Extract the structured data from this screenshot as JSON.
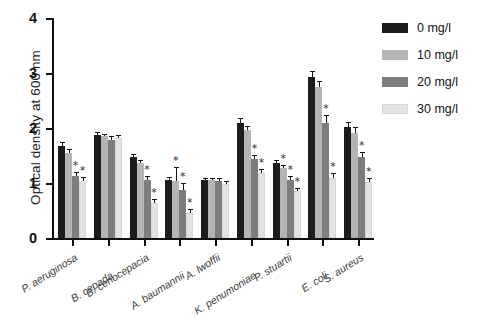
{
  "chart_data": {
    "type": "bar",
    "title": "",
    "xlabel": "",
    "ylabel": "Optical density at 600 nm",
    "ylim": [
      0,
      4
    ],
    "yticks": [
      0,
      1,
      2,
      3,
      4
    ],
    "ytick_labels": [
      "0",
      "1",
      "2",
      "3",
      "4"
    ],
    "grid": false,
    "legend_position": "right",
    "categories": [
      "P. aeruginosa",
      "B. cepada",
      "B. cenocepacia",
      "A. baumannii",
      "A. lwoffii",
      "K. penumoniae",
      "P. stuartii",
      "E. coli",
      "S. aureus"
    ],
    "series": [
      {
        "name": "0 mg/l",
        "color": "#1c1c1c",
        "values": [
          1.67,
          1.87,
          1.47,
          1.05,
          1.05,
          2.1,
          1.36,
          2.92,
          2.02
        ],
        "errors": [
          0.05,
          0.04,
          0.04,
          0.04,
          0.03,
          0.07,
          0.04,
          0.09,
          0.08
        ],
        "significant": [
          false,
          false,
          false,
          false,
          false,
          false,
          false,
          false,
          false
        ]
      },
      {
        "name": "10 mg/l",
        "color": "#b4b4b4",
        "values": [
          1.55,
          1.85,
          1.36,
          1.04,
          1.05,
          1.97,
          1.27,
          2.75,
          1.91
        ],
        "errors": [
          0.05,
          0.03,
          0.04,
          0.24,
          0.03,
          0.05,
          0.04,
          0.09,
          0.09
        ],
        "significant": [
          false,
          false,
          false,
          true,
          false,
          false,
          true,
          false,
          false
        ]
      },
      {
        "name": "20 mg/l",
        "color": "#7d7d7d",
        "values": [
          1.12,
          1.79,
          1.06,
          0.87,
          1.04,
          1.44,
          1.06,
          2.1,
          1.48
        ],
        "errors": [
          0.07,
          0.04,
          0.05,
          0.12,
          0.03,
          0.06,
          0.05,
          0.12,
          0.06
        ],
        "significant": [
          true,
          false,
          true,
          true,
          false,
          true,
          true,
          true,
          true
        ]
      },
      {
        "name": "30 mg/l",
        "color": "#e3e3e3",
        "values": [
          1.04,
          1.81,
          0.63,
          0.45,
          0.98,
          1.18,
          0.85,
          1.09,
          1.02
        ],
        "errors": [
          0.06,
          0.04,
          0.06,
          0.06,
          0.04,
          0.05,
          0.05,
          0.07,
          0.06
        ],
        "significant": [
          true,
          false,
          true,
          true,
          false,
          true,
          true,
          true,
          true
        ]
      }
    ],
    "annotation_symbol": "*",
    "annotation_meaning": "significant"
  },
  "legend": {
    "items": [
      {
        "label": "0 mg/l",
        "color": "#1c1c1c"
      },
      {
        "label": "10 mg/l",
        "color": "#b4b4b4"
      },
      {
        "label": "20 mg/l",
        "color": "#7d7d7d"
      },
      {
        "label": "30 mg/l",
        "color": "#e3e3e3"
      }
    ]
  }
}
